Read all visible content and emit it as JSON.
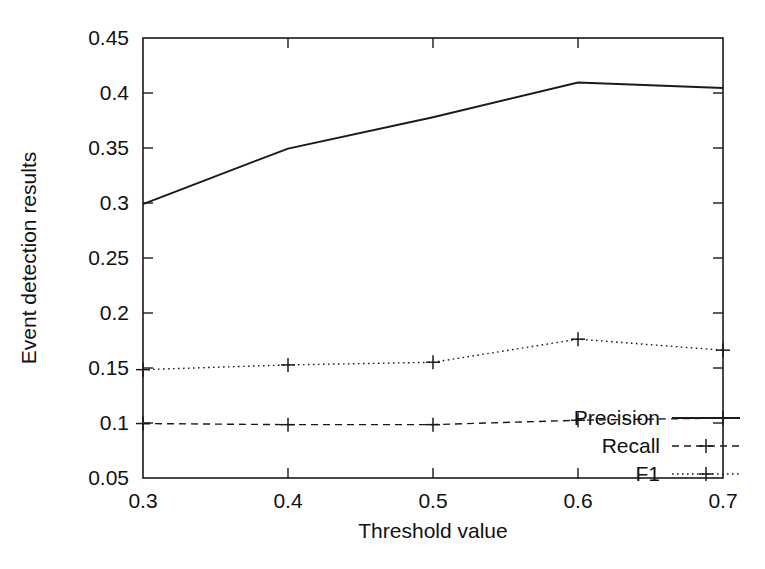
{
  "chart_data": {
    "type": "line",
    "title": "",
    "xlabel": "Threshold value",
    "ylabel": "Event detection results",
    "x": [
      0.3,
      0.4,
      0.5,
      0.6,
      0.7
    ],
    "xlim": [
      0.3,
      0.7
    ],
    "ylim": [
      0.05,
      0.45
    ],
    "xticks": [
      "0.3",
      "0.4",
      "0.5",
      "0.6",
      "0.7"
    ],
    "yticks": [
      "0.05",
      "0.1",
      "0.15",
      "0.2",
      "0.25",
      "0.3",
      "0.35",
      "0.4",
      "0.45"
    ],
    "grid": false,
    "legend_position": "bottom-right",
    "series": [
      {
        "name": "Precision",
        "values": [
          0.299,
          0.3495,
          0.378,
          0.4095,
          0.4045
        ],
        "style": "solid",
        "marker": "none",
        "color": "#1a1a1a"
      },
      {
        "name": "Recall",
        "values": [
          0.0995,
          0.0985,
          0.0985,
          0.1025,
          0.1045
        ],
        "style": "dashed",
        "marker": "plus",
        "color": "#1a1a1a"
      },
      {
        "name": "F1",
        "values": [
          0.1485,
          0.1528,
          0.1552,
          0.1762,
          0.1662
        ],
        "style": "dotted",
        "marker": "plus",
        "color": "#1a1a1a"
      }
    ]
  },
  "legend": {
    "entries": [
      {
        "label": "Precision"
      },
      {
        "label": "Recall"
      },
      {
        "label": "F1"
      }
    ]
  },
  "axes": {
    "x_title": "Threshold value",
    "y_title": "Event detection results"
  }
}
